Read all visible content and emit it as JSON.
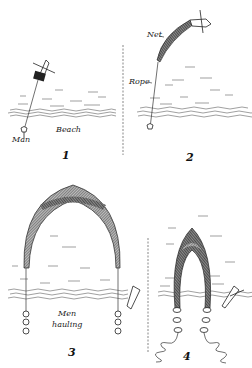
{
  "figure": {
    "panels": [
      {
        "number": "1",
        "labels": {
          "man": "Man",
          "beach": "Beach"
        }
      },
      {
        "number": "2",
        "labels": {
          "net": "Net",
          "rope": "Rope"
        }
      },
      {
        "number": "3",
        "labels": {
          "men_hauling_line1": "Men",
          "men_hauling_line2": "hauling"
        }
      },
      {
        "number": "4",
        "labels": {}
      }
    ],
    "colors": {
      "ink": "#222222",
      "background": "#ffffff",
      "net_fill": "#555555"
    }
  }
}
